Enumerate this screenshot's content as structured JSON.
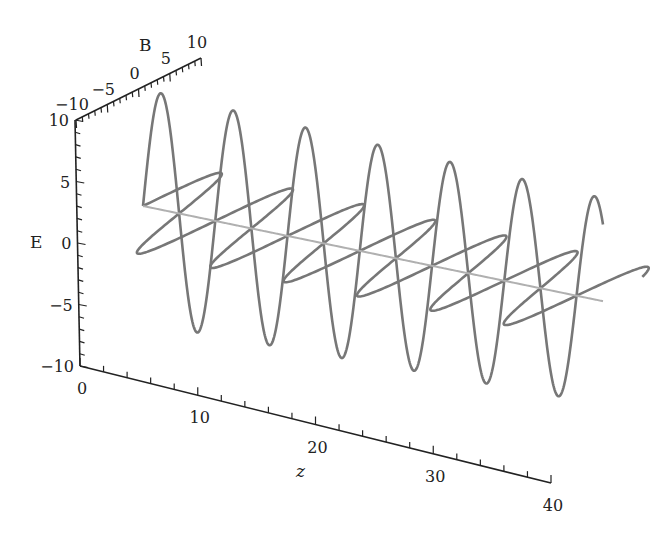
{
  "chart_data": {
    "type": "line",
    "projection": "3d",
    "title": "",
    "axes": {
      "z": {
        "label": "z",
        "range": [
          0,
          40
        ],
        "ticks": [
          0,
          10,
          20,
          30,
          40
        ],
        "minor_step": 2
      },
      "E": {
        "label": "E",
        "range": [
          -10,
          10
        ],
        "ticks": [
          -10,
          -5,
          0,
          5,
          10
        ],
        "minor_step": 1
      },
      "B": {
        "label": "B",
        "range": [
          -10,
          10
        ],
        "ticks": [
          -10,
          -5,
          0,
          5,
          10
        ],
        "minor_step": 1
      }
    },
    "series": [
      {
        "name": "E field",
        "plane": "E",
        "function": "10*sin(z)",
        "amplitude": 10,
        "k": 1,
        "z_range": [
          0,
          40
        ],
        "color": "#777777"
      },
      {
        "name": "B field",
        "plane": "B",
        "function": "10*sin(z)",
        "amplitude": 10,
        "k": 1,
        "z_range": [
          0,
          40
        ],
        "color": "#777777"
      },
      {
        "name": "propagation axis",
        "plane": "center",
        "function": "0",
        "z_range": [
          0,
          40
        ],
        "color": "#b0b0b0"
      }
    ],
    "grid": false,
    "legend": "none"
  }
}
